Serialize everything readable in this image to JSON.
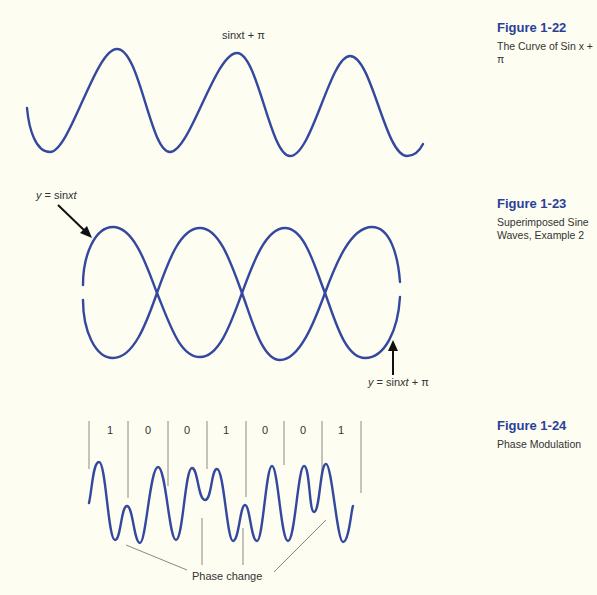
{
  "figures": [
    {
      "number": "Figure 1-22",
      "title": "The Curve of Sin x + π",
      "label": "sinxt + π"
    },
    {
      "number": "Figure 1-23",
      "title_line1": "Superimposed Sine",
      "title_line2": "Waves, Example 2",
      "label_top": "y = sinxt",
      "label_bottom": "y = sinxt + π"
    },
    {
      "number": "Figure 1-24",
      "title": "Phase Modulation",
      "bits": [
        "1",
        "0",
        "0",
        "1",
        "0",
        "0",
        "1"
      ],
      "annotation": "Phase change"
    }
  ],
  "colors": {
    "background": "#fdfdf2",
    "wave": "#33489e",
    "figure_number": "#2b3f99",
    "text": "#333333"
  }
}
